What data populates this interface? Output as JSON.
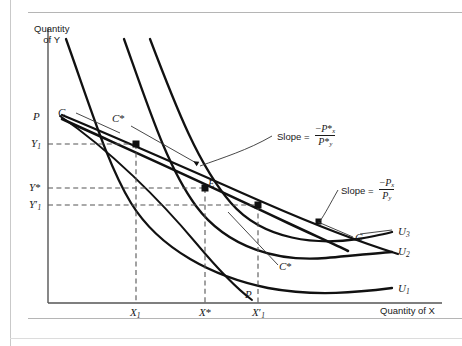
{
  "figure": {
    "type": "economics-indifference-curve-diagram",
    "background": "#ffffff",
    "curve_color": "#111111",
    "axis_color": "#555555",
    "dash_color": "#555555",
    "leader_color": "#333333"
  },
  "axes": {
    "y_title_line1": "Quantity",
    "y_title_line2": "of Y",
    "x_title": "Quantity of X",
    "origin": {
      "x": 48,
      "y": 303
    },
    "x_end": 442,
    "y_top": 28
  },
  "y_labels": [
    {
      "name": "P",
      "text": "P",
      "sub": "",
      "star": false,
      "prime": false,
      "y": 117
    },
    {
      "name": "C",
      "text": "C",
      "sub": "",
      "star": false,
      "prime": false,
      "y": 113
    },
    {
      "name": "Y1",
      "text": "Y",
      "sub": "1",
      "star": false,
      "prime": false,
      "y": 144
    },
    {
      "name": "Ystar",
      "text": "Y",
      "sub": "",
      "star": true,
      "prime": false,
      "y": 188
    },
    {
      "name": "Y1prime",
      "text": "Y",
      "sub": "1",
      "star": false,
      "prime": true,
      "y": 205
    }
  ],
  "x_labels": [
    {
      "name": "X1",
      "text": "X",
      "sub": "1",
      "star": false,
      "prime": false,
      "x": 136
    },
    {
      "name": "Xstar",
      "text": "X",
      "sub": "",
      "star": true,
      "prime": false,
      "x": 205
    },
    {
      "name": "X1prime",
      "text": "X",
      "sub": "1",
      "star": false,
      "prime": true,
      "x": 258
    }
  ],
  "curve_labels": [
    {
      "name": "U3",
      "text": "U",
      "sub": "3",
      "x": 401,
      "y": 232
    },
    {
      "name": "U2",
      "text": "U",
      "sub": "2",
      "x": 401,
      "y": 252
    },
    {
      "name": "U1",
      "text": "U",
      "sub": "1",
      "x": 401,
      "y": 289
    }
  ],
  "point_labels": [
    {
      "name": "equilibrium-E",
      "text": "E",
      "star": false,
      "x": 210,
      "y": 185
    },
    {
      "name": "compensated-C-star-top",
      "text": "C",
      "star": true,
      "x": 116,
      "y": 120
    },
    {
      "name": "compensated-C-star-bottom",
      "text": "C",
      "star": true,
      "x": 282,
      "y": 268
    },
    {
      "name": "budget-line-C-top",
      "text": "C",
      "star": false,
      "x": 62,
      "y": 113
    },
    {
      "name": "budget-line-C-right",
      "text": "C",
      "star": false,
      "x": 358,
      "y": 239
    },
    {
      "name": "price-line-P-top",
      "text": "P",
      "star": false,
      "x": 40,
      "y": 117
    },
    {
      "name": "price-line-P-bottom",
      "text": "P",
      "star": false,
      "x": 248,
      "y": 296
    }
  ],
  "slope_annotations": [
    {
      "name": "slope-compensated",
      "label": "Slope =",
      "numerator_sign": "−",
      "numerator_var": "P",
      "numerator_sub": "x",
      "numerator_star": true,
      "denominator_var": "P",
      "denominator_sub": "y",
      "denominator_star": true,
      "x": 277,
      "y": 131
    },
    {
      "name": "slope-uncompensated",
      "label": "Slope =",
      "numerator_sign": "−",
      "numerator_var": "P",
      "numerator_sub": "x",
      "numerator_star": false,
      "denominator_var": "P",
      "denominator_sub": "y",
      "denominator_star": false,
      "x": 341,
      "y": 185
    }
  ],
  "chart_data": {
    "type": "line",
    "title": "",
    "xlabel": "Quantity of X",
    "ylabel": "Quantity of Y",
    "grid": false,
    "legend_position": "right-of-curves",
    "series": [
      {
        "name": "U1",
        "role": "indifference-curve",
        "label": "U₁"
      },
      {
        "name": "U2",
        "role": "indifference-curve",
        "label": "U₂"
      },
      {
        "name": "U3",
        "role": "indifference-curve",
        "label": "U₃"
      },
      {
        "name": "C",
        "role": "budget-constraint-uncompensated",
        "label": "C"
      },
      {
        "name": "C*",
        "role": "budget-constraint-compensated",
        "label": "C*"
      },
      {
        "name": "PP",
        "role": "price-consumption-path",
        "label": "P"
      }
    ],
    "annotated_points": [
      {
        "label": "E",
        "x": "X*",
        "y": "Y*"
      },
      {
        "label": "",
        "x": "X₁",
        "y": "Y₁"
      },
      {
        "label": "",
        "x": "X'₁",
        "y": "Y'₁"
      }
    ]
  }
}
